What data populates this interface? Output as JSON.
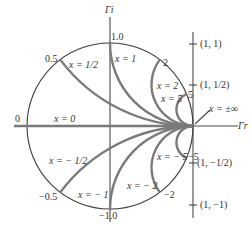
{
  "figure": {
    "type": "Smith chart reactance (x) circles in the reflection-coefficient plane",
    "axes": {
      "imag_label": "Γi",
      "real_label": "Γr"
    },
    "unit_circle_labels": [
      {
        "id": "top",
        "text": "1.0"
      },
      {
        "id": "bottom",
        "text": "−1.0"
      },
      {
        "id": "left",
        "text": "0"
      },
      {
        "id": "p05",
        "text": "0.5"
      },
      {
        "id": "m05",
        "text": "−0.5"
      },
      {
        "id": "p2",
        "text": "2"
      },
      {
        "id": "m2",
        "text": "−2"
      },
      {
        "id": "p5",
        "text": "5"
      },
      {
        "id": "m5",
        "text": "−5"
      }
    ],
    "curve_labels": {
      "x0": "x = 0",
      "xp05": "x = 1/2",
      "xp1": "x = 1",
      "xp2": "x = 2",
      "xp5": "x = 5",
      "xinf": "x = ±∞",
      "xm05": "x = − 1/2",
      "xm1": "x = − 1",
      "xm2": "x = − 2",
      "xm5": "x = − 5"
    },
    "right_axis_ticks": [
      {
        "label": "(1, 1)"
      },
      {
        "label": "(1, 1/2)"
      },
      {
        "label": "(1, −1/2)"
      },
      {
        "label": "(1, −1)"
      }
    ],
    "reactance_values": [
      0,
      0.5,
      1,
      2,
      5,
      -0.5,
      -1,
      -2,
      -5
    ],
    "colors": {
      "axis": "#4a4a4a",
      "unit_circle": "#3c3c3c",
      "reactance_arcs": "#7a7a7a",
      "text": "#333333"
    }
  }
}
